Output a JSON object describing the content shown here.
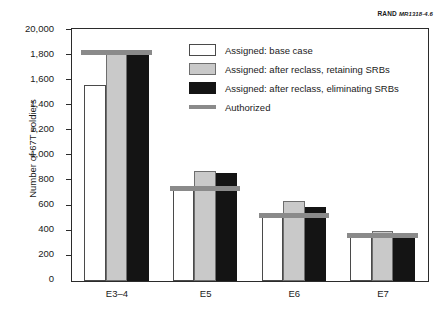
{
  "source_credit": {
    "org": "RAND",
    "figure_id": "MR1318-4.6"
  },
  "chart_data": {
    "type": "bar",
    "title": "",
    "xlabel": "",
    "ylabel": "Number of 67T soldiers",
    "categories": [
      "E3–4",
      "E5",
      "E6",
      "E7"
    ],
    "series": [
      {
        "name": "Assigned:  base case",
        "key": "base",
        "color": "#ffffff",
        "values": [
          1560,
          730,
          515,
          360
        ]
      },
      {
        "name": "Assigned:  after reclass, retaining SRBs",
        "key": "retain",
        "color": "#c9c9c9",
        "values": [
          1815,
          880,
          640,
          400
        ]
      },
      {
        "name": "Assigned:  after reclass, eliminating SRBs",
        "key": "eliminate",
        "color": "#141414",
        "values": [
          1815,
          865,
          590,
          355
        ]
      }
    ],
    "markers": [
      {
        "name": "Authorized",
        "key": "authorized",
        "color": "#8a8a8a",
        "values": [
          1820,
          735,
          525,
          365
        ]
      }
    ],
    "ylim": [
      0,
      2000
    ],
    "yticks": [
      0,
      200,
      400,
      600,
      800,
      1000,
      1200,
      1400,
      1600,
      1800,
      2000
    ],
    "ytick_labels": [
      "0",
      "200",
      "400",
      "600",
      "800",
      "1,000",
      "1,200",
      "1,400",
      "1,600",
      "1,800",
      "20,000"
    ],
    "grid": false,
    "legend_position": "upper right"
  },
  "legend": {
    "items": [
      {
        "label": "Assigned:  base case",
        "swatch": "base"
      },
      {
        "label": "Assigned:  after reclass, retaining SRBs",
        "swatch": "retain"
      },
      {
        "label": "Assigned:  after reclass, eliminating SRBs",
        "swatch": "eliminate"
      },
      {
        "label": "Authorized",
        "swatch": "authorized"
      }
    ]
  }
}
